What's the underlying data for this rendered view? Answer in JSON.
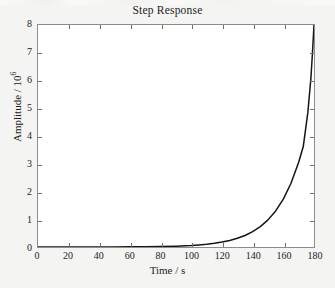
{
  "window": {
    "background_color": "#f4f4f2",
    "toolbar_remnant": "partially-cropped-toolbar"
  },
  "chart_data": {
    "type": "line",
    "title": "Step Response",
    "xlabel": "Time / s",
    "ylabel_text": "Amplitude / 10",
    "ylabel_exponent": "6",
    "ylabel": "Amplitude / 10^6",
    "xlim": [
      0,
      180
    ],
    "ylim": [
      0,
      8
    ],
    "xticks": [
      0,
      20,
      40,
      60,
      80,
      100,
      120,
      140,
      160,
      180
    ],
    "yticks": [
      0,
      1,
      2,
      3,
      4,
      5,
      6,
      7,
      8
    ],
    "xtick_labels": [
      "0",
      "20",
      "40",
      "60",
      "80",
      "100",
      "120",
      "140",
      "160",
      "180"
    ],
    "ytick_labels": [
      "0",
      "1",
      "2",
      "3",
      "4",
      "5",
      "6",
      "7",
      "8"
    ],
    "grid": false,
    "legend": null,
    "box": true,
    "tick_direction": "in",
    "series": [
      {
        "name": "step response",
        "color": "#151515",
        "line_width": 1.5,
        "x": [
          0,
          10,
          20,
          30,
          40,
          50,
          60,
          70,
          80,
          90,
          100,
          105,
          110,
          115,
          120,
          125,
          130,
          135,
          140,
          145,
          150,
          155,
          160,
          165,
          170,
          173,
          176,
          178,
          179,
          180
        ],
        "y": [
          0,
          0,
          0,
          0,
          0.001,
          0.002,
          0.005,
          0.009,
          0.017,
          0.031,
          0.056,
          0.075,
          0.1,
          0.133,
          0.177,
          0.236,
          0.313,
          0.416,
          0.553,
          0.735,
          0.977,
          1.3,
          1.728,
          2.297,
          3.055,
          3.62,
          4.85,
          6.1,
          7.0,
          8.0
        ]
      }
    ]
  }
}
